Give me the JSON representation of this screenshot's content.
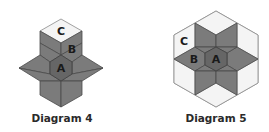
{
  "diagrams": [
    {
      "caption": "Diagram 4",
      "labels": {
        "a": "A",
        "b": "B",
        "c": "C"
      }
    },
    {
      "caption": "Diagram 5",
      "labels": {
        "a": "A",
        "b": "B",
        "c": "C"
      }
    }
  ],
  "colors": {
    "dark_piece": "#7b7b7b",
    "center_piece": "#666666",
    "light_piece": "#f4f4f4",
    "outline": "#4a4a4a"
  }
}
